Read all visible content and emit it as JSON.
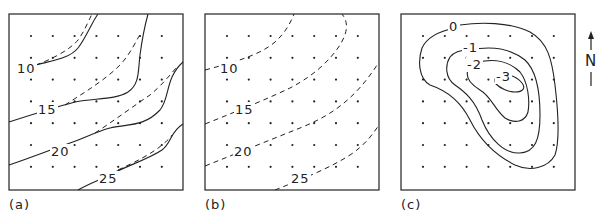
{
  "figure": {
    "panels": [
      {
        "id": "a",
        "label": "(a)",
        "description": "Observed (solid) and fitted (dashed) contours",
        "contour_labels": [
          "10",
          "15",
          "20",
          "25"
        ]
      },
      {
        "id": "b",
        "label": "(b)",
        "description": "Fitted trend surface (dashed)",
        "contour_labels": [
          "10",
          "15",
          "20",
          "25"
        ]
      },
      {
        "id": "c",
        "label": "(c)",
        "description": "Residual contours (solid)",
        "contour_labels": [
          "0",
          "-1",
          "-2",
          "-3"
        ]
      }
    ],
    "north_arrow": {
      "label": "N"
    },
    "grid": {
      "rows": 7,
      "cols": 7
    },
    "colors": {
      "ink": "#222222",
      "background": "#ffffff"
    }
  }
}
